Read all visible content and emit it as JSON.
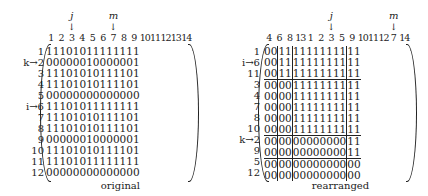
{
  "original": {
    "caption": "original",
    "col_headers": [
      "1",
      "2",
      "3",
      "4",
      "5",
      "6",
      "7",
      "8",
      "9",
      "10",
      "11",
      "12",
      "13",
      "14"
    ],
    "row_labels": [
      "1",
      "k→2",
      "3",
      "4",
      "5",
      "i→6",
      "7",
      "8",
      "9",
      "10",
      "11",
      "12"
    ],
    "pointers": [
      {
        "label": "j",
        "col_index": 2
      },
      {
        "label": "m",
        "col_index": 6
      }
    ],
    "rows": [
      [
        1,
        1,
        1,
        0,
        1,
        0,
        1,
        1,
        1,
        1,
        1,
        1,
        1,
        1
      ],
      [
        0,
        0,
        0,
        0,
        0,
        0,
        1,
        0,
        0,
        0,
        0,
        0,
        0,
        1
      ],
      [
        1,
        1,
        1,
        0,
        1,
        0,
        1,
        0,
        1,
        1,
        1,
        1,
        0,
        1
      ],
      [
        1,
        1,
        1,
        0,
        1,
        0,
        1,
        0,
        1,
        1,
        1,
        1,
        0,
        1
      ],
      [
        0,
        0,
        0,
        0,
        0,
        0,
        0,
        0,
        0,
        0,
        0,
        0,
        0,
        0
      ],
      [
        1,
        1,
        1,
        0,
        1,
        0,
        1,
        1,
        1,
        1,
        1,
        1,
        1,
        1
      ],
      [
        1,
        1,
        1,
        0,
        1,
        0,
        1,
        0,
        1,
        1,
        1,
        1,
        0,
        1
      ],
      [
        1,
        1,
        1,
        0,
        1,
        0,
        1,
        0,
        1,
        1,
        1,
        1,
        0,
        1
      ],
      [
        0,
        0,
        0,
        0,
        0,
        0,
        1,
        0,
        0,
        0,
        0,
        0,
        0,
        1
      ],
      [
        1,
        1,
        1,
        0,
        1,
        0,
        1,
        0,
        1,
        1,
        1,
        1,
        0,
        1
      ],
      [
        1,
        1,
        1,
        0,
        1,
        0,
        1,
        1,
        1,
        1,
        1,
        1,
        1,
        1
      ],
      [
        0,
        0,
        0,
        0,
        0,
        0,
        0,
        0,
        0,
        0,
        0,
        0,
        0,
        0
      ]
    ]
  },
  "rearranged": {
    "caption": "rearranged",
    "col_headers": [
      "4",
      "6",
      "8",
      "13",
      "1",
      "2",
      "3",
      "5",
      "9",
      "10",
      "11",
      "12",
      "7",
      "14"
    ],
    "row_labels": [
      "1",
      "i→6",
      "11",
      "3",
      "4",
      "7",
      "8",
      "10",
      "k→2",
      "9",
      "5",
      "12"
    ],
    "pointers": [
      {
        "label": "j",
        "col_index": 6
      },
      {
        "label": "m",
        "col_index": 12
      }
    ],
    "vertical_dividers_after_col": [
      1,
      3,
      11
    ],
    "horizontal_dividers_after_row": [
      2,
      7,
      9
    ],
    "rows": [
      [
        0,
        0,
        1,
        1,
        1,
        1,
        1,
        1,
        1,
        1,
        1,
        1,
        1,
        1
      ],
      [
        0,
        0,
        1,
        1,
        1,
        1,
        1,
        1,
        1,
        1,
        1,
        1,
        1,
        1
      ],
      [
        0,
        0,
        1,
        1,
        1,
        1,
        1,
        1,
        1,
        1,
        1,
        1,
        1,
        1
      ],
      [
        0,
        0,
        0,
        0,
        1,
        1,
        1,
        1,
        1,
        1,
        1,
        1,
        1,
        1
      ],
      [
        0,
        0,
        0,
        0,
        1,
        1,
        1,
        1,
        1,
        1,
        1,
        1,
        1,
        1
      ],
      [
        0,
        0,
        0,
        0,
        1,
        1,
        1,
        1,
        1,
        1,
        1,
        1,
        1,
        1
      ],
      [
        0,
        0,
        0,
        0,
        1,
        1,
        1,
        1,
        1,
        1,
        1,
        1,
        1,
        1
      ],
      [
        0,
        0,
        0,
        0,
        1,
        1,
        1,
        1,
        1,
        1,
        1,
        1,
        1,
        1
      ],
      [
        0,
        0,
        0,
        0,
        0,
        0,
        0,
        0,
        0,
        0,
        0,
        0,
        1,
        1
      ],
      [
        0,
        0,
        0,
        0,
        0,
        0,
        0,
        0,
        0,
        0,
        0,
        0,
        1,
        1
      ],
      [
        0,
        0,
        0,
        0,
        0,
        0,
        0,
        0,
        0,
        0,
        0,
        0,
        0,
        0
      ],
      [
        0,
        0,
        0,
        0,
        0,
        0,
        0,
        0,
        0,
        0,
        0,
        0,
        0,
        0
      ]
    ]
  }
}
